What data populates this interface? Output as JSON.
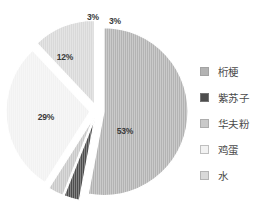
{
  "chart_data": {
    "type": "pie",
    "title": "",
    "subtitle": "",
    "xlabel": "",
    "ylabel": "",
    "exploded": true,
    "start_angle_deg": 0,
    "direction": "clockwise",
    "legend_position": "right",
    "grid": false,
    "categories": [
      "桁梗",
      "紫苏子",
      "华夫粉",
      "鸡蛋",
      "水"
    ],
    "values": [
      53,
      3,
      3,
      29,
      12
    ],
    "value_labels": [
      "53%",
      "3%",
      "3%",
      "29%",
      "12%"
    ],
    "colors": [
      "#b3b3b3",
      "#4d4d4d",
      "#c9c9c9",
      "#f2f2f2",
      "#d9d9d9"
    ],
    "slices": [
      {
        "label": "桁梗",
        "value": 53,
        "value_label": "53%",
        "color": "#b3b3b3",
        "start_deg": 0,
        "end_deg": 190.8,
        "label_x": 125,
        "label_y": 131
      },
      {
        "label": "紫苏子",
        "value": 3,
        "value_label": "3%",
        "color": "#4d4d4d",
        "start_deg": 190.8,
        "end_deg": 201.6,
        "label_x": 115,
        "label_y": 21
      },
      {
        "label": "华夫粉",
        "value": 3,
        "value_label": "3%",
        "color": "#c9c9c9",
        "start_deg": 201.6,
        "end_deg": 212.4,
        "label_x": 93,
        "label_y": 17
      },
      {
        "label": "鸡蛋",
        "value": 29,
        "value_label": "29%",
        "color": "#f2f2f2",
        "start_deg": 212.4,
        "end_deg": 316.8,
        "label_x": 46,
        "label_y": 117
      },
      {
        "label": "水",
        "value": 12,
        "value_label": "12%",
        "color": "#d9d9d9",
        "start_deg": 316.8,
        "end_deg": 360,
        "label_x": 65,
        "label_y": 57
      }
    ]
  },
  "legend": {
    "items": [
      {
        "label": "桁梗",
        "color": "#b3b3b3"
      },
      {
        "label": "紫苏子",
        "color": "#4d4d4d"
      },
      {
        "label": "华夫粉",
        "color": "#c9c9c9"
      },
      {
        "label": "鸡蛋",
        "color": "#f2f2f2"
      },
      {
        "label": "水",
        "color": "#d9d9d9"
      }
    ]
  }
}
